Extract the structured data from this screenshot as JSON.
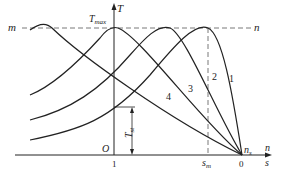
{
  "figure": {
    "type": "torque-speed characteristic diagram",
    "axis_labels": {
      "vertical": "T",
      "horizontal_top": "n",
      "horizontal_bottom": "s"
    },
    "labels": {
      "t_max": "T",
      "t_max_sub": "max",
      "t_start": "T",
      "t_start_sub": "st",
      "origin": "O",
      "m_line": "m",
      "n_line": "n",
      "one": "1",
      "s_m": "s",
      "s_m_sub": "m",
      "zero": "0",
      "n_s": "n",
      "n_s_sub": "s"
    },
    "curves": [
      {
        "id": "1",
        "label": "1"
      },
      {
        "id": "2",
        "label": "2"
      },
      {
        "id": "3",
        "label": "3"
      },
      {
        "id": "4",
        "label": "4"
      }
    ],
    "colors": {
      "line": "#222222",
      "dashed": "#555555",
      "background": "#ffffff"
    }
  }
}
